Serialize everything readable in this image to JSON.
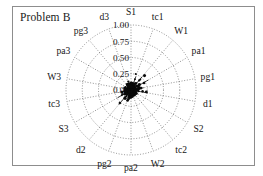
{
  "figure": {
    "title": "Problem B",
    "frame_color": "#8d8d8d",
    "background": "#ffffff"
  },
  "chart_data": {
    "type": "scatter",
    "title": "Problem B",
    "subtitle": "",
    "xlabel": "",
    "ylabel": "",
    "projection": "polar",
    "grid": true,
    "legend": false,
    "legend_position": "none",
    "rlim": [
      0.0,
      1.0
    ],
    "radial_ticks": [
      "0.00",
      "0.25",
      "0.50",
      "0.75",
      "1.00"
    ],
    "radial_tick_values": [
      0.0,
      0.25,
      0.5,
      0.75,
      1.0
    ],
    "n_axes": 18,
    "categories": [
      "S1",
      "tc1",
      "W1",
      "pa1",
      "pg1",
      "d1",
      "S2",
      "tc2",
      "W2",
      "pa2",
      "pg2",
      "d2",
      "S3",
      "tc3",
      "W3",
      "pa3",
      "pg3",
      "d3"
    ],
    "series": [
      {
        "name": "Problem B",
        "marker": "dot",
        "color": "#0a0a0a",
        "values": [
          0.1,
          0.22,
          0.27,
          0.31,
          0.2,
          0.26,
          0.12,
          0.07,
          0.09,
          0.14,
          0.18,
          0.29,
          0.24,
          0.13,
          0.06,
          0.05,
          0.08,
          0.15
        ]
      }
    ],
    "annotations": [
      "Dense dark cluster of points concentrated near the origin (r < 0.1).",
      "A few sparse points extend outward to approximately r = 0.3 toward the upper-right and lower-left sectors."
    ]
  },
  "axis_labels": [
    {
      "label": "S1",
      "angle_deg": 90
    },
    {
      "label": "tc1",
      "angle_deg": 70
    },
    {
      "label": "W1",
      "angle_deg": 50
    },
    {
      "label": "pa1",
      "angle_deg": 30
    },
    {
      "label": "pg1",
      "angle_deg": 10
    },
    {
      "label": "d1",
      "angle_deg": -10
    },
    {
      "label": "S2",
      "angle_deg": -30
    },
    {
      "label": "tc2",
      "angle_deg": -50
    },
    {
      "label": "W2",
      "angle_deg": -70
    },
    {
      "label": "pa2",
      "angle_deg": -90
    },
    {
      "label": "pg2",
      "angle_deg": -110
    },
    {
      "label": "d2",
      "angle_deg": -130
    },
    {
      "label": "S3",
      "angle_deg": -150
    },
    {
      "label": "tc3",
      "angle_deg": -170
    },
    {
      "label": "W3",
      "angle_deg": 170
    },
    {
      "label": "pa3",
      "angle_deg": 150
    },
    {
      "label": "pg3",
      "angle_deg": 130
    },
    {
      "label": "d3",
      "angle_deg": 110
    }
  ]
}
